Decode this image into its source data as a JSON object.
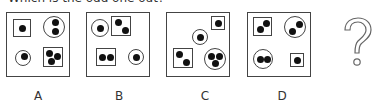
{
  "question": "Which is the odd one out?",
  "unknown_symbol": "?",
  "options": [
    {
      "label": "A",
      "shapes": [
        {
          "type": "square",
          "dots": 1,
          "position": "top-left"
        },
        {
          "type": "circle",
          "dots": 2,
          "position": "top-right"
        },
        {
          "type": "circle",
          "dots": 1,
          "position": "bottom-left"
        },
        {
          "type": "square",
          "dots": 3,
          "position": "bottom-right"
        }
      ]
    },
    {
      "label": "B",
      "shapes": [
        {
          "type": "circle",
          "dots": 1,
          "position": "top-left"
        },
        {
          "type": "square",
          "dots": 2,
          "position": "top-center"
        },
        {
          "type": "square",
          "dots": 2,
          "position": "bottom-left"
        },
        {
          "type": "circle",
          "dots": 1,
          "position": "bottom-right"
        }
      ]
    },
    {
      "label": "C",
      "shapes": [
        {
          "type": "square",
          "dots": 1,
          "position": "top-right"
        },
        {
          "type": "circle",
          "dots": 1,
          "position": "center"
        },
        {
          "type": "square",
          "dots": 2,
          "position": "bottom-left"
        },
        {
          "type": "circle",
          "dots": 3,
          "position": "bottom-right"
        }
      ]
    },
    {
      "label": "D",
      "shapes": [
        {
          "type": "square",
          "dots": 2,
          "position": "top-left"
        },
        {
          "type": "circle",
          "dots": 2,
          "position": "top-right"
        },
        {
          "type": "circle",
          "dots": 2,
          "position": "bottom-left"
        },
        {
          "type": "square",
          "dots": 1,
          "position": "bottom-right"
        }
      ]
    }
  ]
}
